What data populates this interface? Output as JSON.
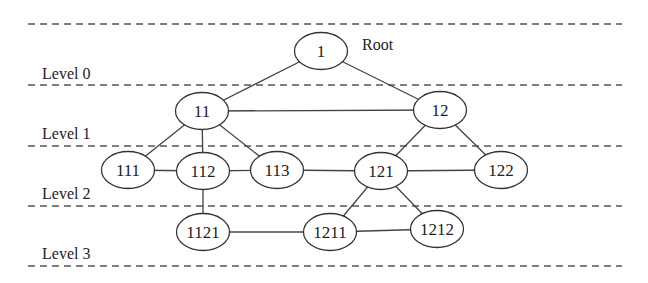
{
  "diagram": {
    "root_label": "Root",
    "levels": [
      {
        "label": "Level 0",
        "y": 79,
        "line_y": 85
      },
      {
        "label": "Level 1",
        "y": 139,
        "line_y": 146
      },
      {
        "label": "Level 2",
        "y": 199,
        "line_y": 206
      },
      {
        "label": "Level 3",
        "y": 259,
        "line_y": 266
      }
    ],
    "top_line_y": 24,
    "nodes": [
      {
        "id": "1",
        "label": "1",
        "cx": 321,
        "cy": 51
      },
      {
        "id": "11",
        "label": "11",
        "cx": 202,
        "cy": 111
      },
      {
        "id": "12",
        "label": "12",
        "cx": 440,
        "cy": 110
      },
      {
        "id": "111",
        "label": "111",
        "cx": 128,
        "cy": 170
      },
      {
        "id": "112",
        "label": "112",
        "cx": 203,
        "cy": 171
      },
      {
        "id": "113",
        "label": "113",
        "cx": 277,
        "cy": 170
      },
      {
        "id": "121",
        "label": "121",
        "cx": 381,
        "cy": 171
      },
      {
        "id": "122",
        "label": "122",
        "cx": 501,
        "cy": 170
      },
      {
        "id": "1121",
        "label": "1121",
        "cx": 203,
        "cy": 232
      },
      {
        "id": "1211",
        "label": "1211",
        "cx": 330,
        "cy": 232
      },
      {
        "id": "1212",
        "label": "1212",
        "cx": 437,
        "cy": 229
      }
    ],
    "edges": [
      [
        "1",
        "11"
      ],
      [
        "1",
        "12"
      ],
      [
        "11",
        "12"
      ],
      [
        "11",
        "111"
      ],
      [
        "11",
        "112"
      ],
      [
        "11",
        "113"
      ],
      [
        "12",
        "121"
      ],
      [
        "12",
        "122"
      ],
      [
        "111",
        "112"
      ],
      [
        "112",
        "113"
      ],
      [
        "113",
        "121"
      ],
      [
        "121",
        "122"
      ],
      [
        "112",
        "1121"
      ],
      [
        "121",
        "1211"
      ],
      [
        "121",
        "1212"
      ],
      [
        "1121",
        "1211"
      ],
      [
        "1211",
        "1212"
      ]
    ]
  }
}
